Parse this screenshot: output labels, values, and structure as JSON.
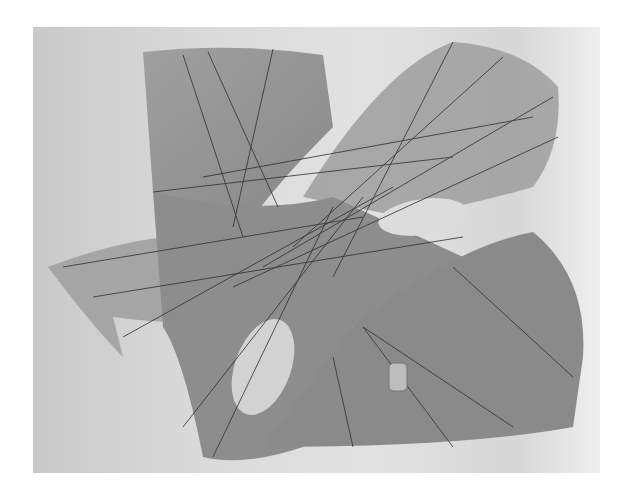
{
  "image": {
    "subject": "ruled-surface-sculpture",
    "description": "Grayscale photograph of a translucent hyperbolic paraboloid-like sculpture with straight ruling lines",
    "colors": {
      "background": "#d8d8d8",
      "surface": "#8f8f8f",
      "lines": "#2e2e2e"
    }
  },
  "label": {
    "text": ""
  }
}
